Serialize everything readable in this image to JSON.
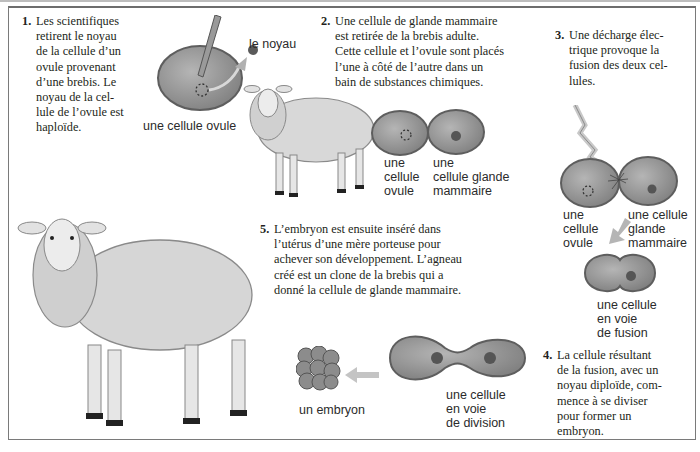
{
  "figure": {
    "type": "diagram"
  },
  "steps": [
    {
      "number": "1.",
      "text": "Les scientifiques\nretirent le noyau\nde la cellule d’un\novule provenant\nd’une brebis. Le\nnoyau de la cel-\nlule de l’ovule est\nhaploïde."
    },
    {
      "number": "2.",
      "text": "Une cellule de glande mammaire\nest retirée de la brebis adulte.\nCette cellule et l’ovule sont placés\nl’une à côté de l’autre dans un\nbain de substances chimiques."
    },
    {
      "number": "3.",
      "text": "Une décharge élec-\ntrique provoque la\nfusion des deux cel-\nlules."
    },
    {
      "number": "4.",
      "text": "La cellule résultant\nde la fusion, avec un\nnoyau diploïde, com-\nmence à se diviser\npour former un\nembryon."
    },
    {
      "number": "5.",
      "text": "L’embryon est ensuite inséré dans\nl’utérus d’une mère porteuse pour\nachever son développement. L’agneau\ncréé est un clone de la brebis qui a\ndonné la cellule de glande mammaire."
    }
  ],
  "labels": {
    "ovule_step1": "une cellule ovule",
    "nucleus": "le noyau",
    "ovule_step2": "une\ncellule\novule",
    "mammary_step2": "une\ncellule glande\nmammaire",
    "ovule_step3": "une\ncellule\novule",
    "mammary_step3": "une cellule\nglande\nmammaire",
    "fusing_cell": "une cellule\nen voie\nde fusion",
    "dividing_cell": "une cellule\nen voie\nde division",
    "embryo": "un embryon"
  },
  "colors": {
    "cell_fill": "#8f8f8f",
    "cell_edge": "#5e5e5e",
    "nucleus": "#4a4a4a",
    "arrow": "#b0b0b0",
    "frame": "#7a7a7a",
    "text": "#231f20"
  }
}
